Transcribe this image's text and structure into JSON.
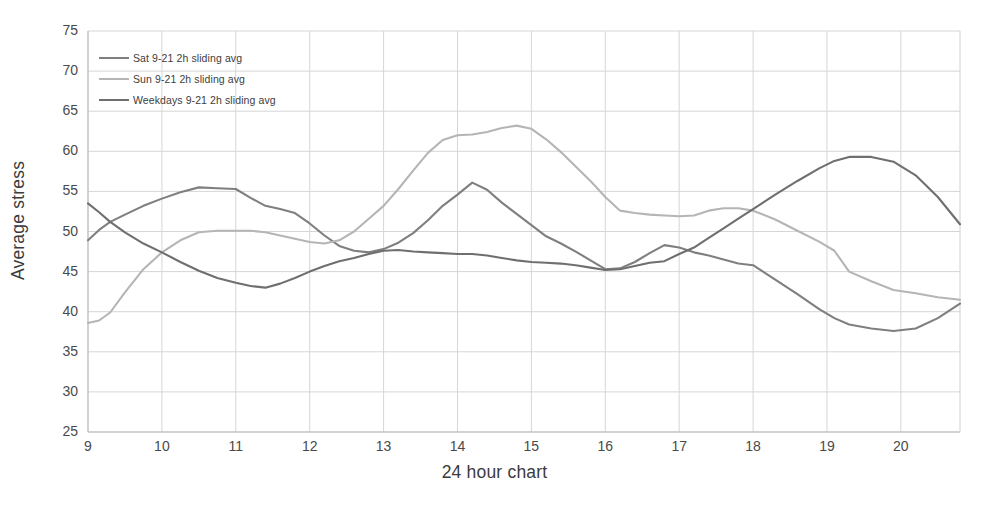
{
  "chart_data": {
    "type": "line",
    "title": "",
    "xlabel": "24 hour chart",
    "ylabel": "Average stress",
    "xlim": [
      9,
      20.8
    ],
    "ylim": [
      25,
      75
    ],
    "xticks": [
      "9",
      "10",
      "11",
      "12",
      "13",
      "14",
      "15",
      "16",
      "17",
      "18",
      "19",
      "20"
    ],
    "yticks": [
      "75",
      "70",
      "65",
      "60",
      "55",
      "50",
      "45",
      "40",
      "35",
      "30",
      "25"
    ],
    "grid": true,
    "legend_position": "upper-left-inside",
    "x": [
      9.0,
      9.15,
      9.3,
      9.5,
      9.75,
      10.0,
      10.25,
      10.5,
      10.75,
      11.0,
      11.2,
      11.4,
      11.6,
      11.8,
      12.0,
      12.2,
      12.4,
      12.6,
      12.8,
      13.0,
      13.2,
      13.4,
      13.6,
      13.8,
      14.0,
      14.2,
      14.4,
      14.6,
      14.8,
      15.0,
      15.2,
      15.4,
      15.6,
      15.8,
      16.0,
      16.2,
      16.4,
      16.6,
      16.8,
      17.0,
      17.2,
      17.4,
      17.6,
      17.8,
      18.0,
      18.3,
      18.6,
      18.9,
      19.1,
      19.3,
      19.6,
      19.9,
      20.2,
      20.5,
      20.8
    ],
    "series": [
      {
        "name": "Sat 9-21 2h sliding avg",
        "color": "#7f7f7f",
        "values": [
          48.9,
          50.2,
          51.2,
          52.1,
          53.2,
          54.1,
          54.9,
          55.5,
          55.4,
          55.3,
          54.2,
          53.2,
          52.8,
          52.3,
          51.0,
          49.5,
          48.2,
          47.6,
          47.4,
          47.8,
          48.6,
          49.8,
          51.4,
          53.2,
          54.6,
          56.1,
          55.2,
          53.6,
          52.2,
          50.8,
          49.4,
          48.5,
          47.5,
          46.4,
          45.3,
          45.4,
          46.2,
          47.3,
          48.3,
          48.0,
          47.4,
          47.0,
          46.5,
          46.0,
          45.8,
          44.0,
          42.2,
          40.3,
          39.2,
          38.4,
          37.9,
          37.6,
          37.9,
          39.2,
          41.0
        ]
      },
      {
        "name": "Sun 9-21 2h sliding avg",
        "color": "#b5b5b5",
        "values": [
          38.6,
          38.9,
          39.9,
          42.4,
          45.3,
          47.4,
          48.9,
          49.9,
          50.1,
          50.1,
          50.1,
          49.9,
          49.5,
          49.1,
          48.7,
          48.5,
          48.9,
          50.0,
          51.6,
          53.2,
          55.3,
          57.6,
          59.8,
          61.4,
          62.0,
          62.1,
          62.4,
          62.9,
          63.2,
          62.8,
          61.5,
          59.9,
          58.1,
          56.3,
          54.3,
          52.6,
          52.3,
          52.1,
          52.0,
          51.9,
          52.0,
          52.6,
          52.9,
          52.9,
          52.6,
          51.5,
          50.1,
          48.7,
          47.6,
          45.0,
          43.8,
          42.7,
          42.3,
          41.8,
          41.5
        ]
      },
      {
        "name": "Weekdays 9-21 2h sliding avg",
        "color": "#6f6f6f",
        "values": [
          53.5,
          52.4,
          51.2,
          49.9,
          48.5,
          47.4,
          46.2,
          45.1,
          44.2,
          43.6,
          43.2,
          43.0,
          43.5,
          44.2,
          45.0,
          45.7,
          46.3,
          46.7,
          47.2,
          47.6,
          47.7,
          47.5,
          47.4,
          47.3,
          47.2,
          47.2,
          47.0,
          46.7,
          46.4,
          46.2,
          46.1,
          46.0,
          45.8,
          45.5,
          45.2,
          45.3,
          45.7,
          46.1,
          46.3,
          47.2,
          48.0,
          49.2,
          50.4,
          51.6,
          52.8,
          54.6,
          56.3,
          57.9,
          58.8,
          59.3,
          59.3,
          58.7,
          57.0,
          54.3,
          50.9
        ]
      }
    ]
  },
  "legend": {
    "items": [
      {
        "label": "Sat 9-21 2h sliding avg",
        "color": "#7f7f7f"
      },
      {
        "label": "Sun 9-21 2h sliding avg",
        "color": "#b5b5b5"
      },
      {
        "label": "Weekdays 9-21 2h sliding avg",
        "color": "#6f6f6f"
      }
    ]
  },
  "axes": {
    "x_title": "24 hour chart",
    "y_title": "Average stress"
  }
}
